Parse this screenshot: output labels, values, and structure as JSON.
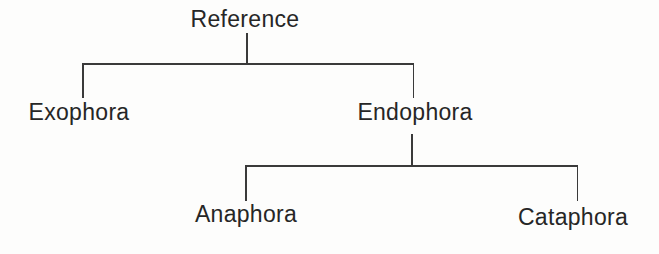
{
  "diagram": {
    "type": "tree",
    "root": {
      "label": "Reference",
      "children": [
        {
          "label": "Exophora",
          "children": []
        },
        {
          "label": "Endophora",
          "children": [
            {
              "label": "Anaphora",
              "children": []
            },
            {
              "label": "Cataphora",
              "children": []
            }
          ]
        }
      ]
    }
  },
  "colors": {
    "background": "#fdfdfc",
    "line": "#3a3a3a",
    "text": "#262626"
  }
}
